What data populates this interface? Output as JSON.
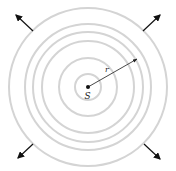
{
  "diagram": {
    "center": {
      "x": 88,
      "y": 87
    },
    "ring_radii": [
      13,
      29,
      46,
      55,
      63,
      79
    ],
    "ring_color": "#d4d4d4",
    "ring_width": 2,
    "source_label": "S",
    "radius_label": "r",
    "radius_arrow": {
      "x2": 137,
      "y2": 59
    },
    "outward_arrows": [
      {
        "from": [
          33,
          31
        ],
        "to": [
          16,
          15
        ]
      },
      {
        "from": [
          143,
          31
        ],
        "to": [
          160,
          15
        ]
      },
      {
        "from": [
          33,
          144
        ],
        "to": [
          18,
          158
        ]
      },
      {
        "from": [
          144,
          144
        ],
        "to": [
          160,
          159
        ]
      }
    ],
    "arrow_color": "#111111"
  }
}
